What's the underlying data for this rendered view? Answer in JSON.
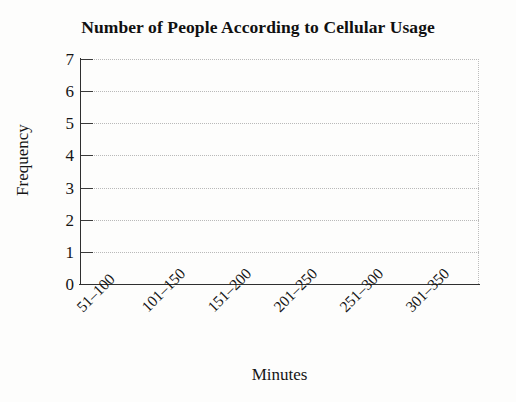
{
  "chart_data": {
    "type": "bar",
    "title": "Number of People According to Cellular Usage",
    "xlabel": "Minutes",
    "ylabel": "Frequency",
    "categories": [
      "51–100",
      "101–150",
      "151–200",
      "201–250",
      "251–300",
      "301–350"
    ],
    "values": [
      0,
      0,
      0,
      0,
      0,
      0
    ],
    "ylim": [
      0,
      7
    ],
    "ytick_labels": [
      "7",
      "6",
      "5",
      "4",
      "3",
      "2",
      "1",
      "0"
    ],
    "ytick_values": [
      7,
      6,
      5,
      4,
      3,
      2,
      1,
      0
    ],
    "grid": "horizontal-dotted",
    "legend": "none",
    "note": "Blank grid template — no bars plotted"
  },
  "colors": {
    "axis": "#2f2f2f",
    "gridline": "#b9b9b9",
    "text": "#151515",
    "background": "#fdfdfc"
  }
}
